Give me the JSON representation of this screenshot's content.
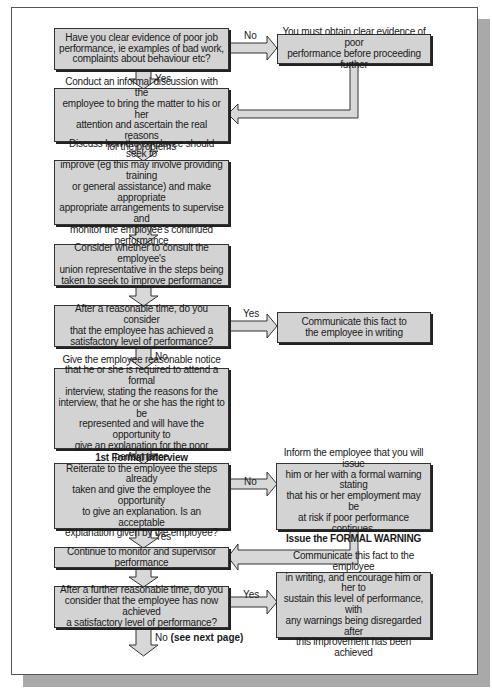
{
  "flowchart": {
    "steps": [
      {
        "id": "q_evidence",
        "text": "Have you clear evidence of poor job\nperformance, ie examples of bad work,\ncomplaints about behaviour etc?"
      },
      {
        "id": "obtain_evidence",
        "text": "You must obtain clear evidence of poor\nperformance before proceeding further"
      },
      {
        "id": "informal_discussion",
        "text": "Conduct an informal discussion with the\nemployee to bring the matter to his or her\nattention and ascertain the real reasons\nfor the problems"
      },
      {
        "id": "discuss_improve",
        "text": "Discuss how the employee should seek to\nimprove (eg this may involve providing training\nor general assistance) and make appropriate\nappropriate arrangements to supervise and\nmonitor the employee's continued performance"
      },
      {
        "id": "consult_union",
        "text": "Consider whether to consult the employee's\nunion representative in the steps being\ntaken to seek to improve performance"
      },
      {
        "id": "q_satisfactory",
        "text": "After a reasonable time, do you consider\nthat the employee has achieved a\nsatisfactory level of performance?"
      },
      {
        "id": "communicate_writing",
        "text": "Communicate this fact to\nthe employee in writing"
      },
      {
        "id": "notice_interview",
        "text": "Give the employee reasonable notice\nthat he or she is required to attend a formal\ninterview, stating the reasons for the\ninterview, that he or she has the right to be\nrepresented and will have the opportunity to\ngive an explanation for the poor performance"
      },
      {
        "id": "first_interview",
        "title": "1st Formal Interview",
        "text": "Reiterate to the employee the steps already\ntaken and give the employee the opportunity\nto give an explanation. Is an acceptable\nexplanation given by the employee?"
      },
      {
        "id": "formal_warning",
        "text": "Inform the employee that you will issue\nhim or her with a formal warning stating\nthat his or her employment may be\nat risk if poor performance continues.",
        "emphasis": "Issue the FORMAL WARNING"
      },
      {
        "id": "continue_monitor",
        "text": "Continue to monitor and supervisor performance"
      },
      {
        "id": "q_further",
        "text": "After a further reasonable time, do you\nconsider that the employee has now achieved\na satisfactory level of performance?"
      },
      {
        "id": "communicate_sustain",
        "text": "Communicate this fact to the employee\nin writing, and encourage him or her to\nsustain this level of performance, with\nany warnings being disregarded after\nthis improvement has been achieved"
      }
    ],
    "labels": {
      "no1": "No",
      "yes1": "Yes",
      "yes2": "Yes",
      "no2": "No",
      "no3": "No",
      "yes3": "Yes",
      "yes4": "Yes",
      "no_final": "No",
      "no_final_bold": "(see next page)"
    },
    "colors": {
      "box_fill": "#d3d3d3",
      "box_border": "#333333",
      "arrow_fill": "#d8d8d8",
      "page_shadow": "#a9a9a9"
    }
  }
}
